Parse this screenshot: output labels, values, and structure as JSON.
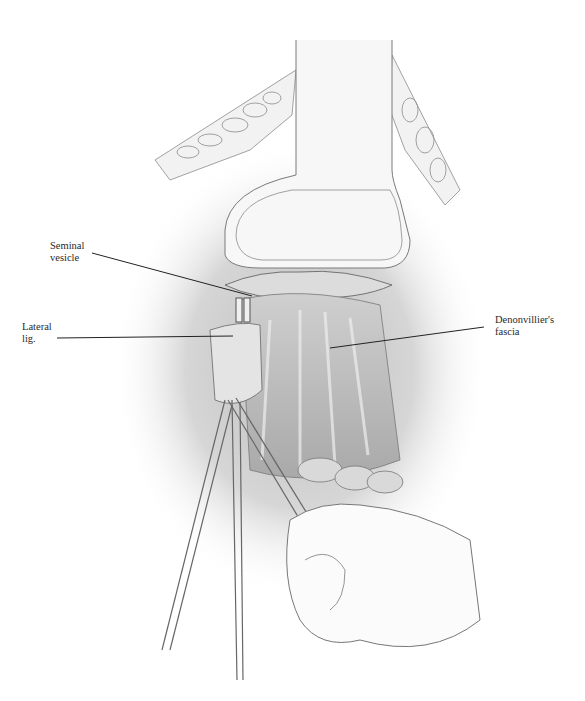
{
  "figure": {
    "labels": [
      {
        "id": "seminal-vesicle",
        "lines": [
          "Seminal",
          "vesicle"
        ]
      },
      {
        "id": "lateral-lig",
        "lines": [
          "Lateral",
          "lig."
        ]
      },
      {
        "id": "denonvilliers-fascia",
        "lines": [
          "Denonvillier's",
          "fascia"
        ]
      }
    ]
  }
}
